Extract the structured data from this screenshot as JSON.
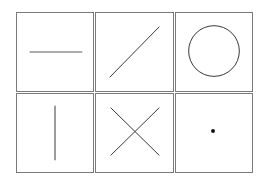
{
  "grid": {
    "rows": 2,
    "cols": 3,
    "border_color": "#7a7a7a",
    "stroke_color": "#333333",
    "cells": [
      {
        "shape": "horizontal-line"
      },
      {
        "shape": "diagonal-line"
      },
      {
        "shape": "circle"
      },
      {
        "shape": "vertical-line"
      },
      {
        "shape": "x-cross"
      },
      {
        "shape": "dot"
      }
    ]
  }
}
